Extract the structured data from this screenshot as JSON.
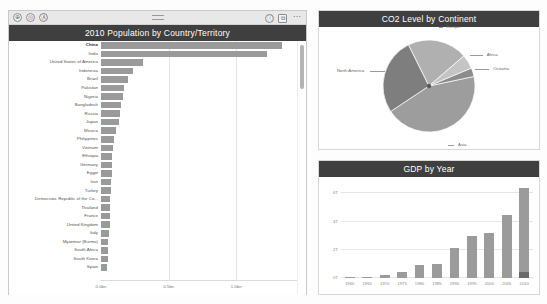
{
  "toolbar": {
    "left_icons": [
      "focus-icon",
      "filter-icon",
      "accessibility-icon"
    ],
    "right_icons": [
      "info-icon",
      "focus-mode-icon",
      "more-options-icon"
    ],
    "left_glyphs": [
      "⊕",
      "◎",
      "Ⓐ"
    ],
    "right_glyphs": [
      "ⓘ",
      "⧉",
      "⋯"
    ],
    "grip": "drag-handle"
  },
  "bar_panel": {
    "title": "2010 Population by Country/Territory",
    "scrollbar": "vertical-scrollbar"
  },
  "pie_panel": {
    "title": "CO2 Level by Continent"
  },
  "gdp_panel": {
    "title": "GDP by Year"
  },
  "chart_data": [
    {
      "type": "bar",
      "title": "2010 Population by Country/Territory",
      "orientation": "horizontal",
      "xlabel": "",
      "ylabel": "",
      "xlim": [
        0,
        1.45
      ],
      "grid": true,
      "tick_labels": [
        "0.0bn",
        "0.5bn",
        "1.0bn"
      ],
      "tick_values": [
        0,
        0.5,
        1.0
      ],
      "categories": [
        "China",
        "India",
        "United States of America",
        "Indonesia",
        "Brazil",
        "Pakistan",
        "Nigeria",
        "Bangladesh",
        "Russia",
        "Japan",
        "Mexico",
        "Philippines",
        "Vietnam",
        "Ethiopia",
        "Germany",
        "Egypt",
        "Iran",
        "Turkey",
        "Democratic Republic of the Co...",
        "Thailand",
        "France",
        "United Kingdom",
        "Italy",
        "Myanmar (Burma)",
        "South Africa",
        "South Korea",
        "Spain"
      ],
      "values": [
        1.34,
        1.23,
        0.31,
        0.24,
        0.2,
        0.17,
        0.16,
        0.15,
        0.14,
        0.13,
        0.11,
        0.093,
        0.087,
        0.083,
        0.082,
        0.078,
        0.074,
        0.072,
        0.066,
        0.067,
        0.065,
        0.063,
        0.06,
        0.052,
        0.051,
        0.049,
        0.046
      ],
      "highlighted_category": "China"
    },
    {
      "type": "pie",
      "title": "CO2 Level by Continent",
      "labels": [
        "Asia",
        "North America",
        "Europe",
        "Africa",
        "Oceania"
      ],
      "values": [
        44,
        27,
        21,
        5,
        3
      ],
      "legend": "labels-with-leader-lines"
    },
    {
      "type": "bar",
      "title": "GDP by Year",
      "orientation": "vertical",
      "xlabel": "",
      "ylabel": "",
      "ylim": [
        0,
        6.6
      ],
      "grid": true,
      "tick_labels": [
        "0T",
        "2T",
        "4T",
        "6T"
      ],
      "tick_values": [
        0,
        2,
        4,
        6
      ],
      "categories": [
        "1960",
        "1965",
        "1970",
        "1975",
        "1980",
        "1985",
        "1990",
        "1995",
        "2000",
        "2005",
        "2010"
      ],
      "series": [
        {
          "name": "series-a",
          "values": [
            0.04,
            0.1,
            0.18,
            0.42,
            0.92,
            1.0,
            2.15,
            2.95,
            3.22,
            4.45,
            6.4
          ]
        },
        {
          "name": "series-b",
          "values": [
            0,
            0,
            0,
            0,
            0,
            0,
            0,
            0,
            0,
            0,
            0.45
          ]
        }
      ]
    }
  ],
  "colors": {
    "title_bar": "#3f3f3f",
    "bar_fill": "#9a9a9a",
    "bar_dark": "#6b6b6b",
    "grid": "#e4e4e4",
    "toolbar": "#e8e8e8"
  }
}
